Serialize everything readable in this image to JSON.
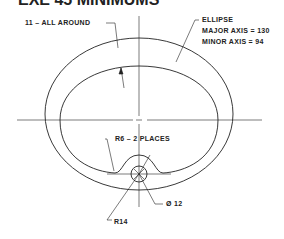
{
  "title": "EXE 45 MINIMUMS",
  "labels": {
    "wall": "11 – ALL AROUND",
    "ellipse_title": "ELLIPSE",
    "major_axis": "MAJOR AXIS = 130",
    "minor_axis": "MINOR AXIS =  94",
    "fillet": "R6 –   2 PLACES",
    "hole": "Ø 12",
    "notch_radius": "R14"
  },
  "colors": {
    "line": "#222222",
    "background": "#ffffff"
  }
}
